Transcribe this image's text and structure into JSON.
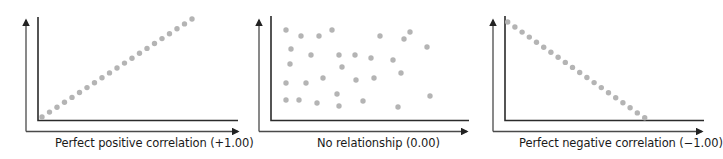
{
  "chart_data": [
    {
      "type": "scatter",
      "title": "Perfect positive correlation (+1.00)",
      "xlabel": "Perfect positive correlation (+1.00)",
      "ylabel": "",
      "correlation": 1.0,
      "grid": false,
      "legend": null,
      "xlim": [
        0,
        100
      ],
      "ylim": [
        0,
        100
      ],
      "x": [
        2,
        5.5,
        9,
        12.5,
        16,
        19.5,
        23,
        26.5,
        30,
        33.5,
        37,
        40.5,
        44,
        47.5,
        51,
        54.5,
        58,
        61.5,
        65,
        68.5,
        72
      ],
      "y": [
        3,
        7.8,
        12.6,
        17.4,
        22.2,
        27,
        31.8,
        36.6,
        41.4,
        46.2,
        51,
        55.8,
        60.6,
        65.4,
        70.2,
        75,
        79.8,
        84.6,
        89.4,
        94.2,
        99
      ]
    },
    {
      "type": "scatter",
      "title": "No relationship (0.00)",
      "xlabel": "No relationship (0.00)",
      "ylabel": "",
      "correlation": 0.0,
      "grid": false,
      "legend": null,
      "xlim": [
        0,
        100
      ],
      "ylim": [
        0,
        100
      ],
      "x": [
        7,
        15,
        23,
        31,
        53,
        65,
        67,
        76,
        9,
        20,
        33,
        41,
        48,
        59,
        9,
        36,
        62,
        7,
        17,
        26,
        42,
        51,
        7,
        14,
        23,
        33,
        34,
        45,
        62,
        79
      ],
      "y": [
        87,
        81,
        81,
        87,
        81,
        78,
        85,
        71,
        68,
        63,
        63,
        63,
        60,
        58,
        54,
        51,
        45,
        35,
        35,
        40,
        38,
        41,
        19,
        19,
        16,
        25,
        13,
        18,
        12,
        23
      ]
    },
    {
      "type": "scatter",
      "title": "Perfect negative correlation (−1.00)",
      "xlabel": "Perfect negative correlation (−1.00)",
      "ylabel": "",
      "correlation": -1.0,
      "grid": false,
      "legend": null,
      "xlim": [
        0,
        100
      ],
      "ylim": [
        0,
        100
      ],
      "x": [
        1.5,
        5.1,
        8.7,
        12.3,
        15.9,
        19.5,
        23.1,
        26.7,
        30.3,
        33.9,
        37.5,
        41.1,
        44.7,
        48.3,
        51.9,
        55.5,
        59.1,
        62.7,
        66.3,
        69.9
      ],
      "y": [
        94,
        89.2,
        84.4,
        79.6,
        74.8,
        70,
        65.2,
        60.4,
        55.6,
        50.8,
        46,
        41.2,
        36.4,
        31.6,
        26.8,
        22,
        17.2,
        12.4,
        7.6,
        2.8
      ]
    }
  ],
  "style": {
    "dot_color": "#b4b4b4",
    "axis_color": "#2b2b2b",
    "outer_axis_color": "#4a4a4a",
    "dot_radius": 2.7
  },
  "panels": [
    {
      "label": "Perfect positive correlation (+1.00)",
      "outer_axis": {
        "x": 26,
        "y_top": 18,
        "y_base": 131.5,
        "x_end": 240
      },
      "inner_axis": {
        "x": 38,
        "y_top": 17,
        "y_base": 120.5,
        "x_end": 238
      },
      "points_px": [
        [
          42,
          117
        ],
        [
          49.5,
          112.1
        ],
        [
          57,
          107.2
        ],
        [
          64.5,
          102.3
        ],
        [
          72,
          97.4
        ],
        [
          79.5,
          92.5
        ],
        [
          87,
          87.6
        ],
        [
          94.5,
          82.7
        ],
        [
          102,
          77.8
        ],
        [
          109.5,
          72.9
        ],
        [
          117,
          68
        ],
        [
          124.5,
          63.1
        ],
        [
          132,
          58.2
        ],
        [
          139.5,
          53.3
        ],
        [
          147,
          48.4
        ],
        [
          154.5,
          43.5
        ],
        [
          162,
          38.6
        ],
        [
          169.5,
          33.7
        ],
        [
          177,
          28.8
        ],
        [
          184.5,
          23.9
        ],
        [
          192,
          19
        ]
      ]
    },
    {
      "label": "No relationship (0.00)",
      "outer_axis": {
        "x": 259,
        "y_top": 18,
        "y_base": 131.5,
        "x_end": 469
      },
      "inner_axis": {
        "x": 271,
        "y_top": 16,
        "y_base": 120.5,
        "x_end": 469
      },
      "points_px": [
        [
          286,
          30
        ],
        [
          301,
          36
        ],
        [
          319,
          36
        ],
        [
          332,
          30
        ],
        [
          380,
          36
        ],
        [
          404,
          39
        ],
        [
          410,
          32
        ],
        [
          427,
          47
        ],
        [
          291,
          49
        ],
        [
          311,
          55
        ],
        [
          339,
          55
        ],
        [
          355,
          55
        ],
        [
          371,
          58
        ],
        [
          393,
          60
        ],
        [
          290,
          64
        ],
        [
          342,
          67
        ],
        [
          401,
          73
        ],
        [
          286,
          83
        ],
        [
          306,
          83
        ],
        [
          323,
          78
        ],
        [
          356,
          80
        ],
        [
          374,
          78
        ],
        [
          286,
          100
        ],
        [
          299,
          100
        ],
        [
          317,
          103
        ],
        [
          337,
          94
        ],
        [
          339,
          106
        ],
        [
          363,
          101
        ],
        [
          398,
          107
        ],
        [
          430,
          96
        ]
      ]
    },
    {
      "label": "Perfect negative correlation (−1.00)",
      "outer_axis": {
        "x": 493,
        "y_top": 18,
        "y_base": 131.5,
        "x_end": 704
      },
      "inner_axis": {
        "x": 505,
        "y_top": 16,
        "y_base": 120.5,
        "x_end": 704
      },
      "points_px": [
        [
          507.7,
          22
        ],
        [
          514.9,
          27
        ],
        [
          522.1,
          32.1
        ],
        [
          529.3,
          37.1
        ],
        [
          536.5,
          42.2
        ],
        [
          543.7,
          47.2
        ],
        [
          550.9,
          52.3
        ],
        [
          558.1,
          57.3
        ],
        [
          565.3,
          62.4
        ],
        [
          572.5,
          67.4
        ],
        [
          579.7,
          72.5
        ],
        [
          586.9,
          77.5
        ],
        [
          594.1,
          82.6
        ],
        [
          601.3,
          87.6
        ],
        [
          608.5,
          92.7
        ],
        [
          615.7,
          97.7
        ],
        [
          622.9,
          102.8
        ],
        [
          630.1,
          107.8
        ],
        [
          637.3,
          112.9
        ],
        [
          644.7,
          117.7
        ]
      ]
    }
  ]
}
